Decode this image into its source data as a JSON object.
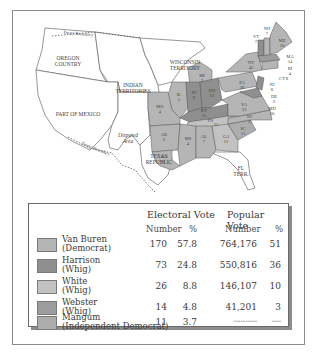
{
  "map": {
    "regions": {
      "oregon_country": "OREGON\nCOUNTRY",
      "oregon_line1": "OREGON",
      "oregon_line2": "COUNTRY",
      "wisconsin_line1": "WISCONSIN",
      "wisconsin_line2": "TERRITORY",
      "indian_line1": "INDIAN",
      "indian_line2": "TERRITORIES",
      "mexico": "PART OF MEXICO",
      "disputed_line1": "Disputed",
      "disputed_line2": "Area",
      "texas_line1": "TEXAS",
      "texas_line2": "REPUBLIC",
      "florida_line1": "FL",
      "florida_line2": "TERR.",
      "treaty_top": "Treaty Boundary",
      "treaty_bottom": "Treaty Boundary"
    },
    "states": [
      {
        "abbr": "ME",
        "ev": "10",
        "winner": "Van Buren"
      },
      {
        "abbr": "NH",
        "ev": "7",
        "winner": "Van Buren"
      },
      {
        "abbr": "VT",
        "ev": "7",
        "winner": "Harrison"
      },
      {
        "abbr": "MA",
        "ev": "14",
        "winner": "Webster"
      },
      {
        "abbr": "RI",
        "ev": "4",
        "winner": "Van Buren"
      },
      {
        "abbr": "CT",
        "ev": "8",
        "winner": "Van Buren"
      },
      {
        "abbr": "NY",
        "ev": "42",
        "winner": "Van Buren"
      },
      {
        "abbr": "NJ",
        "ev": "8",
        "winner": "Harrison"
      },
      {
        "abbr": "PA",
        "ev": "30",
        "winner": "Van Buren"
      },
      {
        "abbr": "DE",
        "ev": "3",
        "winner": "Harrison"
      },
      {
        "abbr": "MD",
        "ev": "10",
        "winner": "Harrison"
      },
      {
        "abbr": "VA",
        "ev": "23",
        "winner": "Van Buren"
      },
      {
        "abbr": "NC",
        "ev": "15",
        "winner": "Van Buren"
      },
      {
        "abbr": "SC",
        "ev": "11",
        "winner": "Mangum"
      },
      {
        "abbr": "GA",
        "ev": "11",
        "winner": "White"
      },
      {
        "abbr": "AL",
        "ev": "7",
        "winner": "Van Buren"
      },
      {
        "abbr": "MS",
        "ev": "4",
        "winner": "Van Buren"
      },
      {
        "abbr": "LA",
        "ev": "5",
        "winner": "Van Buren"
      },
      {
        "abbr": "AR",
        "ev": "3",
        "winner": "Van Buren"
      },
      {
        "abbr": "TN",
        "ev": "15",
        "winner": "White"
      },
      {
        "abbr": "KY",
        "ev": "15",
        "winner": "Harrison"
      },
      {
        "abbr": "OH",
        "ev": "21",
        "winner": "Harrison"
      },
      {
        "abbr": "IN",
        "ev": "9",
        "winner": "Harrison"
      },
      {
        "abbr": "IL",
        "ev": "5",
        "winner": "Van Buren"
      },
      {
        "abbr": "MO",
        "ev": "4",
        "winner": "Van Buren"
      },
      {
        "abbr": "MI",
        "ev": "3",
        "winner": "Van Buren"
      }
    ]
  },
  "legend": {
    "header_electoral": "Electoral Vote",
    "header_popular": "Popular Vote",
    "sub_number": "Number",
    "sub_percent": "%",
    "rows": [
      {
        "name": "Van Buren",
        "party": "(Democrat)",
        "ev_num": "170",
        "ev_pct": "57.8",
        "pv_num": "764,176",
        "pv_pct": "51",
        "color": "#b5b5b5"
      },
      {
        "name": "Harrison",
        "party": "(Whig)",
        "ev_num": "73",
        "ev_pct": "24.8",
        "pv_num": "550,816",
        "pv_pct": "36",
        "color": "#8f8f8f"
      },
      {
        "name": "White",
        "party": "(Whig)",
        "ev_num": "26",
        "ev_pct": "8.8",
        "pv_num": "146,107",
        "pv_pct": "10",
        "color": "#c2c2c2"
      },
      {
        "name": "Webster",
        "party": "(Whig)",
        "ev_num": "14",
        "ev_pct": "4.8",
        "pv_num": "41,201",
        "pv_pct": "3",
        "color": "#9c9c9c"
      },
      {
        "name": "Mangum",
        "party": "(Independent Democrat)",
        "ev_num": "11",
        "ev_pct": "3.7",
        "pv_num": "----------",
        "pv_pct": "----",
        "color": "#adadad"
      }
    ]
  }
}
